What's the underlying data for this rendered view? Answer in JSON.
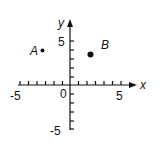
{
  "diagram": {
    "type": "coordinate-plane",
    "axes": {
      "x_label": "x",
      "y_label": "y",
      "origin_label": "0"
    },
    "x_ticks": {
      "min": -5,
      "max": 5,
      "labels": [
        "-5",
        "5"
      ]
    },
    "y_ticks": {
      "min": -5,
      "max": 5,
      "labels": [
        "5",
        "-5"
      ]
    },
    "points": [
      {
        "label": "A",
        "x": -3,
        "y": 4
      },
      {
        "label": "B",
        "x": 2.4,
        "y": 3.5
      }
    ],
    "colors": {
      "ink": "#111111",
      "background": "#ffffff"
    }
  }
}
